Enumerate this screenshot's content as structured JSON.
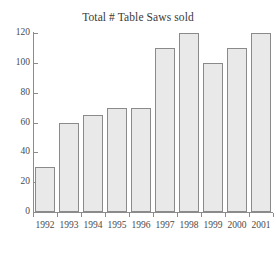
{
  "chart_data": {
    "type": "bar",
    "title": "Total # Table Saws sold",
    "xlabel": "",
    "ylabel": "",
    "categories": [
      "1992",
      "1993",
      "1994",
      "1995",
      "1996",
      "1997",
      "1998",
      "1999",
      "2000",
      "2001"
    ],
    "values": [
      30,
      60,
      65,
      70,
      70,
      110,
      120,
      100,
      110,
      120
    ],
    "ylim": [
      0,
      120
    ],
    "yticks": [
      0,
      20,
      40,
      60,
      80,
      100,
      120
    ],
    "ytick_labels": [
      "0",
      "20",
      "40",
      "60",
      "80",
      "100",
      "120"
    ],
    "grid": false,
    "legend": false,
    "bar_fill_color": "#e9e9e9",
    "bar_border_color": "#8a8a8a",
    "axis_color": "#8c8c8c",
    "background_color": "#ffffff"
  }
}
